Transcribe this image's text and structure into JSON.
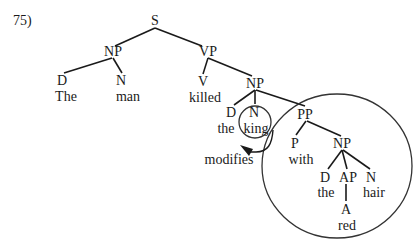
{
  "example_number": "75)",
  "annotation": {
    "label": "modifies",
    "from": "PP",
    "to": "N-king"
  },
  "tree": {
    "root": "S",
    "nodes": {
      "S": {
        "label": "S"
      },
      "NP1": {
        "label": "NP"
      },
      "D1": {
        "label": "D",
        "word": "The"
      },
      "N1": {
        "label": "N",
        "word": "man"
      },
      "VP": {
        "label": "VP"
      },
      "V": {
        "label": "V",
        "word": "killed"
      },
      "NP2": {
        "label": "NP"
      },
      "D2": {
        "label": "D",
        "word": "the"
      },
      "N2": {
        "label": "N",
        "word": "king"
      },
      "PP": {
        "label": "PP"
      },
      "P": {
        "label": "P",
        "word": "with"
      },
      "NP3": {
        "label": "NP"
      },
      "D3": {
        "label": "D",
        "word": "the"
      },
      "AP": {
        "label": "AP"
      },
      "A": {
        "label": "A",
        "word": "red"
      },
      "N3": {
        "label": "N",
        "word": "hair"
      }
    },
    "edges": [
      [
        "S",
        "NP1"
      ],
      [
        "S",
        "VP"
      ],
      [
        "NP1",
        "D1"
      ],
      [
        "NP1",
        "N1"
      ],
      [
        "VP",
        "V"
      ],
      [
        "VP",
        "NP2"
      ],
      [
        "NP2",
        "D2"
      ],
      [
        "NP2",
        "N2"
      ],
      [
        "NP2",
        "PP"
      ],
      [
        "PP",
        "P"
      ],
      [
        "PP",
        "NP3"
      ],
      [
        "NP3",
        "D3"
      ],
      [
        "NP3",
        "AP"
      ],
      [
        "NP3",
        "N3"
      ],
      [
        "AP",
        "A"
      ]
    ],
    "bracketing": "[S [NP [D The] [N man]] [VP [V killed] [NP [D the] [N king] [PP [P with] [NP [D the] [AP [A red]] [N hair]]]]]]"
  },
  "highlights": [
    {
      "type": "circle",
      "encloses": "N-king"
    },
    {
      "type": "ellipse",
      "encloses": "PP-subtree"
    }
  ]
}
